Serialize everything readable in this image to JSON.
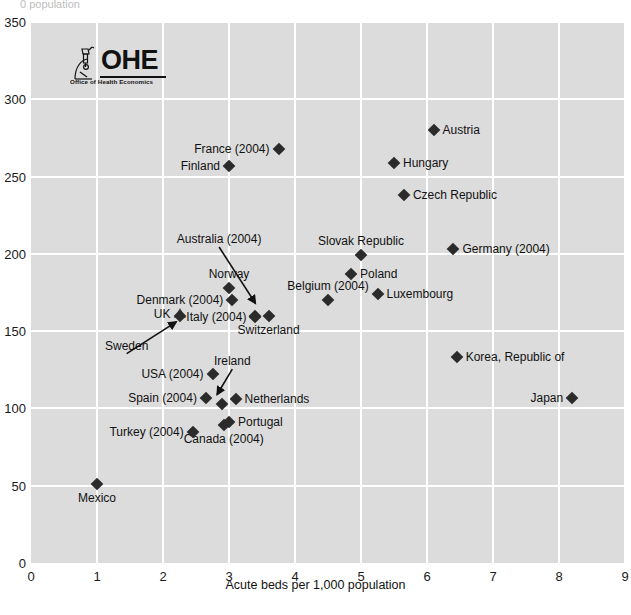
{
  "logo": {
    "name": "ohe-logo",
    "acronym": "OHE",
    "subtitle": "Office of Health Economics",
    "icon": "microscope-icon"
  },
  "axes": {
    "x_title": "Acute beds per 1,000 population",
    "y_title_clipped": "0 population",
    "x_ticks": [
      "0",
      "1",
      "2",
      "3",
      "4",
      "5",
      "6",
      "7",
      "8",
      "9"
    ],
    "y_ticks": [
      "0",
      "50",
      "100",
      "150",
      "200",
      "250",
      "300",
      "350"
    ]
  },
  "colors": {
    "plot_background": "#dcdcdc",
    "gridline": "#ffffff",
    "marker": "#2b2b2b",
    "text": "#111111",
    "page_background": "#ffffff"
  },
  "chart_data": {
    "type": "scatter",
    "title": "",
    "subtitle": "",
    "xlabel": "Acute beds per 1,000 population",
    "ylabel": "Acute care discharges per 1,000 population",
    "xlim": [
      0,
      9
    ],
    "ylim": [
      0,
      350
    ],
    "xticks": [
      0,
      1,
      2,
      3,
      4,
      5,
      6,
      7,
      8,
      9
    ],
    "yticks": [
      0,
      50,
      100,
      150,
      200,
      250,
      300,
      350
    ],
    "grid": true,
    "legend": "none",
    "marker_shape": "diamond",
    "points": [
      {
        "label": "Austria",
        "x": 6.1,
        "y": 280,
        "lpos": "r"
      },
      {
        "label": "France (2004)",
        "x": 3.75,
        "y": 268,
        "lpos": "l"
      },
      {
        "label": "Hungary",
        "x": 5.5,
        "y": 259,
        "lpos": "r"
      },
      {
        "label": "Finland",
        "x": 3.0,
        "y": 257,
        "lpos": "l"
      },
      {
        "label": "Czech Republic",
        "x": 5.65,
        "y": 238,
        "lpos": "r"
      },
      {
        "label": "Germany (2004)",
        "x": 6.4,
        "y": 203,
        "lpos": "r"
      },
      {
        "label": "Slovak Republic",
        "x": 5.0,
        "y": 199,
        "lpos": "above"
      },
      {
        "label": "Poland",
        "x": 4.85,
        "y": 187,
        "lpos": "r"
      },
      {
        "label": "Norway",
        "x": 3.0,
        "y": 178,
        "lpos": "above"
      },
      {
        "label": "Luxembourg",
        "x": 5.25,
        "y": 174,
        "lpos": "r"
      },
      {
        "label": "Belgium (2004)",
        "x": 4.5,
        "y": 170,
        "lpos": "above"
      },
      {
        "label": "Denmark (2004)",
        "x": 3.05,
        "y": 170,
        "lpos": "l"
      },
      {
        "label": "Australia (2004)",
        "x": 3.4,
        "y": 160,
        "lpos": "arrow"
      },
      {
        "label": "Switzerland",
        "x": 3.6,
        "y": 160,
        "lpos": "below"
      },
      {
        "label": "Italy (2004)",
        "x": 3.4,
        "y": 159,
        "lpos": "l"
      },
      {
        "label": "UK",
        "x": 2.25,
        "y": 161,
        "lpos": "l",
        "shape": "triangle"
      },
      {
        "label": "Sweden",
        "x": 2.25,
        "y": 160,
        "lpos": "arrow"
      },
      {
        "label": "Korea, Republic of",
        "x": 6.45,
        "y": 133,
        "lpos": "r"
      },
      {
        "label": "USA (2004)",
        "x": 2.75,
        "y": 122,
        "lpos": "l"
      },
      {
        "label": "Japan",
        "x": 8.2,
        "y": 107,
        "lpos": "l"
      },
      {
        "label": "Netherlands",
        "x": 3.1,
        "y": 106,
        "lpos": "r"
      },
      {
        "label": "Spain (2004)",
        "x": 2.65,
        "y": 107,
        "lpos": "l"
      },
      {
        "label": "Ireland",
        "x": 2.9,
        "y": 103,
        "lpos": "arrow"
      },
      {
        "label": "Portugal",
        "x": 3.0,
        "y": 91,
        "lpos": "r"
      },
      {
        "label": "Canada (2004)",
        "x": 2.92,
        "y": 89,
        "lpos": "below"
      },
      {
        "label": "Turkey (2004)",
        "x": 2.45,
        "y": 85,
        "lpos": "l"
      },
      {
        "label": "Mexico",
        "x": 1.0,
        "y": 51,
        "lpos": "below"
      }
    ],
    "annotations": [
      {
        "label": "Australia (2004)",
        "text_x": 2.85,
        "text_y": 207,
        "tip_x": 3.4,
        "tip_y": 168
      },
      {
        "label": "Sweden",
        "text_x": 1.45,
        "text_y": 138,
        "tip_x": 2.2,
        "tip_y": 156
      },
      {
        "label": "Ireland",
        "text_x": 3.05,
        "text_y": 128,
        "tip_x": 2.82,
        "tip_y": 109
      }
    ]
  }
}
